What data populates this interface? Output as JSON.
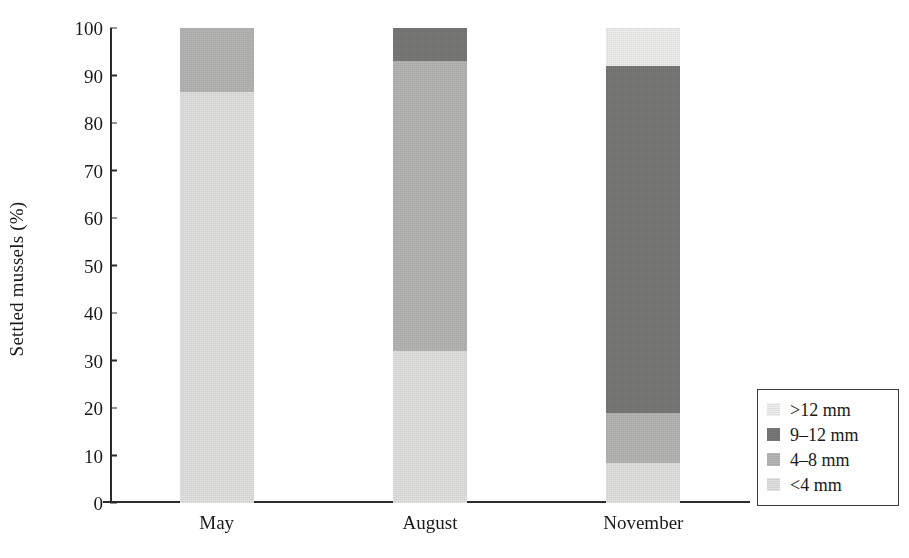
{
  "chart_data": {
    "type": "bar",
    "stacked": true,
    "title": "",
    "xlabel": "",
    "ylabel": "Settled mussels (%)",
    "categories": [
      "May",
      "August",
      "November"
    ],
    "ylim": [
      0,
      100
    ],
    "yticks": [
      0,
      10,
      20,
      30,
      40,
      50,
      60,
      70,
      80,
      90,
      100
    ],
    "ytick_labels": [
      "0",
      "10",
      "20",
      "30",
      "40",
      "50",
      "60",
      "70",
      "80",
      "90",
      "100"
    ],
    "grid": false,
    "legend_position": "bottom-right",
    "legend_order": [
      ">12 mm",
      "9–12 mm",
      "4–8 mm",
      "<4 mm"
    ],
    "series": [
      {
        "name": "<4 mm",
        "color": "#e2e2e0",
        "values": [
          86.5,
          32.0,
          8.5
        ]
      },
      {
        "name": "4–8 mm",
        "color": "#b6b6b4",
        "values": [
          13.5,
          61.0,
          10.5
        ]
      },
      {
        "name": "9–12 mm",
        "color": "#787876",
        "values": [
          0.0,
          7.0,
          73.0
        ]
      },
      {
        "name": ">12 mm",
        "color": "#efefed",
        "values": [
          0.0,
          0.0,
          8.0
        ]
      }
    ],
    "stack_order_bottom_to_top": [
      "<4 mm",
      "4–8 mm",
      "9–12 mm",
      ">12 mm"
    ]
  },
  "axis": {
    "y_title": "Settled mussels (%)"
  },
  "legend": {
    "items": [
      {
        "label": ">12 mm",
        "color": "#efefed"
      },
      {
        "label": "9–12 mm",
        "color": "#787876"
      },
      {
        "label": "4–8 mm",
        "color": "#b6b6b4"
      },
      {
        "label": "<4 mm",
        "color": "#e2e2e0"
      }
    ]
  }
}
